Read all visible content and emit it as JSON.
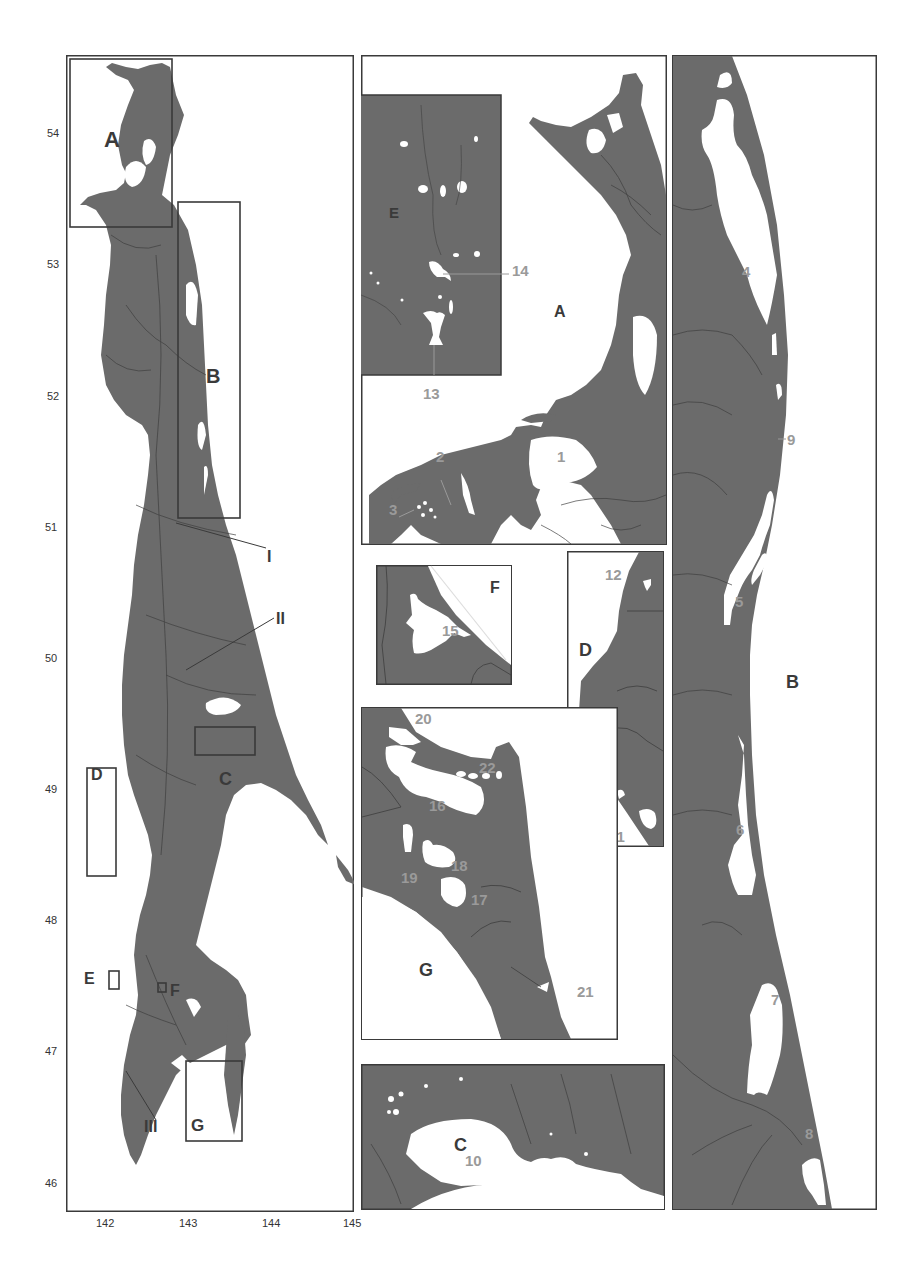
{
  "colors": {
    "land": "#6b6b6b",
    "water": "#ffffff",
    "river": "#3d3d3d",
    "frame": "#3a3a3a",
    "label_dark": "#3a3a3a",
    "label_light": "#9a9a9a"
  },
  "overview": {
    "y_ticks": [
      "54",
      "53",
      "52",
      "51",
      "50",
      "49",
      "48",
      "47",
      "46"
    ],
    "x_ticks": [
      "142",
      "143",
      "144",
      "145"
    ],
    "inset_labels": {
      "A": "A",
      "B": "B",
      "C": "C",
      "D": "D",
      "E": "E",
      "F": "F",
      "G": "G"
    },
    "river_labels": [
      "I",
      "II",
      "III"
    ]
  },
  "panel_A": {
    "label": "A",
    "inset_E_label": "E",
    "lagoons": [
      "1",
      "2",
      "3"
    ],
    "lakes_E": [
      "13",
      "14"
    ]
  },
  "panel_F": {
    "label": "F",
    "lakes": [
      "15"
    ]
  },
  "panel_D": {
    "label": "D",
    "lakes": [
      "12",
      "11"
    ]
  },
  "panel_G": {
    "label": "G",
    "lakes": [
      "16",
      "17",
      "18",
      "19",
      "20",
      "21",
      "22"
    ]
  },
  "panel_C": {
    "label": "C",
    "lakes": [
      "10"
    ]
  },
  "panel_B": {
    "label": "B",
    "lagoons": [
      "4",
      "5",
      "6",
      "7",
      "8",
      "9"
    ]
  }
}
